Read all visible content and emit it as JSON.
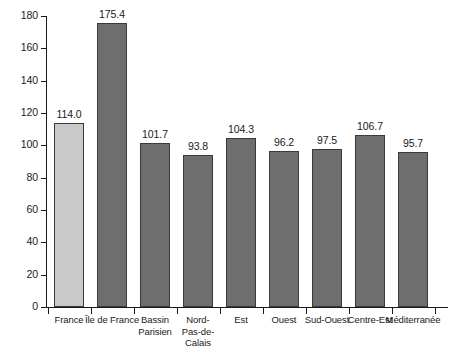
{
  "chart_data": {
    "type": "bar",
    "title": "",
    "subtitle": "",
    "xlabel": "",
    "ylabel": "",
    "ylim": [
      0,
      180
    ],
    "yticks": [
      0,
      20,
      40,
      60,
      80,
      100,
      120,
      140,
      160,
      180
    ],
    "ytick_labels": [
      "0",
      "20",
      "40",
      "60",
      "80",
      "100",
      "120",
      "140",
      "160",
      "180"
    ],
    "grid": false,
    "legend": null,
    "categories": [
      "France",
      "Île de France",
      "Bassin\nParisien",
      "Nord-\nPas-de-Calais",
      "Est",
      "Ouest",
      "Sud-Ouest",
      "Centre-Est",
      "Méditerranée"
    ],
    "values": [
      114.0,
      175.4,
      101.7,
      93.8,
      104.3,
      96.2,
      97.5,
      106.7,
      95.7
    ],
    "value_labels": [
      "114.0",
      "175.4",
      "101.7",
      "93.8",
      "104.3",
      "96.2",
      "97.5",
      "106.7",
      "95.7"
    ],
    "bar_colors": [
      "#c9c9c9",
      "#6e6e6e",
      "#6e6e6e",
      "#6e6e6e",
      "#6e6e6e",
      "#6e6e6e",
      "#6e6e6e",
      "#6e6e6e",
      "#6e6e6e"
    ],
    "bar_border_color": "#3a3a3a",
    "axis_color": "#1a1a1a",
    "background_color": "#ffffff"
  }
}
